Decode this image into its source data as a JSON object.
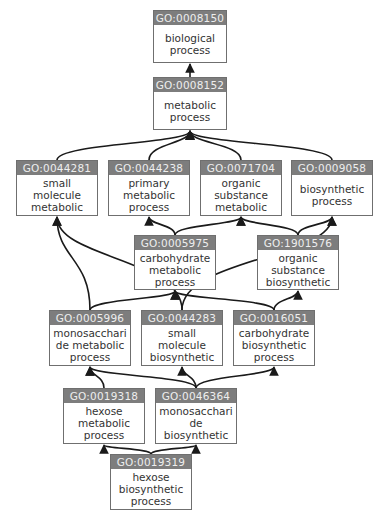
{
  "graph": {
    "title": "GO term ancestry graph",
    "colors": {
      "header_bg": "#7d7d7d",
      "header_text": "#eeeeee",
      "border": "#6f6f6f",
      "edge": "#1a1a1a",
      "label_text": "#333333"
    },
    "nodes": [
      {
        "id": "GO:0008150",
        "label": "biological\nprocess",
        "box": [
          153,
          10,
          74,
          53
        ]
      },
      {
        "id": "GO:0008152",
        "label": "metabolic\nprocess",
        "box": [
          153,
          77,
          74,
          53
        ]
      },
      {
        "id": "GO:0044281",
        "label": "small\nmolecule\nmetabolic",
        "box": [
          16,
          160,
          82,
          56
        ]
      },
      {
        "id": "GO:0044238",
        "label": "primary\nmetabolic\nprocess",
        "box": [
          108,
          160,
          82,
          56
        ]
      },
      {
        "id": "GO:0071704",
        "label": "organic\nsubstance\nmetabolic",
        "box": [
          200,
          160,
          82,
          56
        ]
      },
      {
        "id": "GO:0009058",
        "label": "biosynthetic\nprocess",
        "box": [
          291,
          160,
          82,
          56
        ]
      },
      {
        "id": "GO:0005975",
        "label": "carbohydrate\nmetabolic\nprocess",
        "box": [
          134,
          235,
          82,
          55
        ]
      },
      {
        "id": "GO:1901576",
        "label": "organic\nsubstance\nbiosynthetic",
        "box": [
          257,
          235,
          82,
          55
        ]
      },
      {
        "id": "GO:0005996",
        "label": "monosacchari\nde metabolic\nprocess",
        "box": [
          49,
          310,
          82,
          56
        ]
      },
      {
        "id": "GO:0044283",
        "label": "small\nmolecule\nbiosynthetic",
        "box": [
          141,
          310,
          82,
          56
        ]
      },
      {
        "id": "GO:0016051",
        "label": "carbohydrate\nbiosynthetic\nprocess",
        "box": [
          233,
          310,
          82,
          56
        ]
      },
      {
        "id": "GO:0019318",
        "label": "hexose\nmetabolic\nprocess",
        "box": [
          63,
          388,
          82,
          56
        ]
      },
      {
        "id": "GO:0046364",
        "label": "monosacchari\nde\nbiosynthetic",
        "box": [
          155,
          388,
          82,
          56
        ]
      },
      {
        "id": "GO:0019319",
        "label": "hexose\nbiosynthetic\nprocess",
        "box": [
          110,
          454,
          82,
          56
        ]
      }
    ],
    "edges": [
      {
        "from": "GO:0008152",
        "to": "GO:0008150"
      },
      {
        "from": "GO:0044281",
        "to": "GO:0008152"
      },
      {
        "from": "GO:0044238",
        "to": "GO:0008152"
      },
      {
        "from": "GO:0071704",
        "to": "GO:0008152"
      },
      {
        "from": "GO:0009058",
        "to": "GO:0008152"
      },
      {
        "from": "GO:0005975",
        "to": "GO:0044238"
      },
      {
        "from": "GO:0005975",
        "to": "GO:0071704"
      },
      {
        "from": "GO:1901576",
        "to": "GO:0071704"
      },
      {
        "from": "GO:1901576",
        "to": "GO:0009058"
      },
      {
        "from": "GO:0005996",
        "to": "GO:0044281"
      },
      {
        "from": "GO:0005996",
        "to": "GO:0005975"
      },
      {
        "from": "GO:0044283",
        "to": "GO:0044281"
      },
      {
        "from": "GO:0044283",
        "to": "GO:0009058"
      },
      {
        "from": "GO:0016051",
        "to": "GO:0005975"
      },
      {
        "from": "GO:0016051",
        "to": "GO:1901576"
      },
      {
        "from": "GO:0019318",
        "to": "GO:0005996"
      },
      {
        "from": "GO:0046364",
        "to": "GO:0005996"
      },
      {
        "from": "GO:0046364",
        "to": "GO:0044283"
      },
      {
        "from": "GO:0046364",
        "to": "GO:0016051"
      },
      {
        "from": "GO:0019319",
        "to": "GO:0019318"
      },
      {
        "from": "GO:0019319",
        "to": "GO:0046364"
      }
    ]
  }
}
